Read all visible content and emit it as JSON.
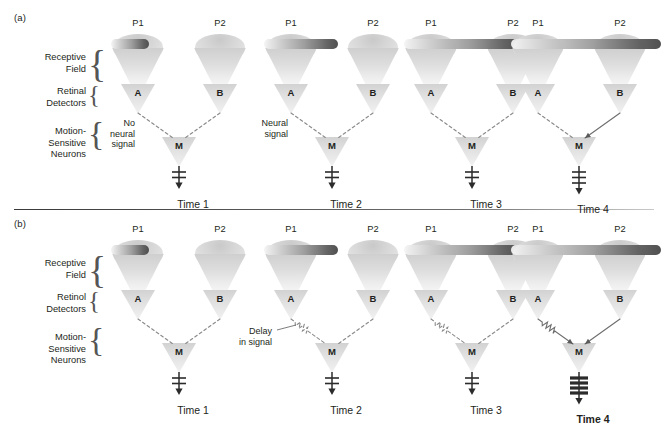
{
  "figure": {
    "panels": [
      {
        "tag": "(a)",
        "row_labels": {
          "receptive_field": "Receptive\nField",
          "detectors": "Retinal\nDetectors",
          "neurons": "Motion-\nSensitive\nNeurons"
        },
        "columns": [
          {
            "time_label": "Time 1",
            "time_bold": false,
            "p1_label": "P1",
            "p2_label": "P2",
            "detector_left": "A",
            "detector_right": "B",
            "neuron": "M",
            "annotation": "No\nneural\nsignal",
            "bar_start": 0,
            "bar_end": 38,
            "left_line": "dashed",
            "right_line": "dashed",
            "left_delay": false,
            "spikes": 2,
            "spike_weight": "thin"
          },
          {
            "time_label": "Time 2",
            "time_bold": false,
            "p1_label": "P1",
            "p2_label": "P2",
            "detector_left": "A",
            "detector_right": "B",
            "neuron": "M",
            "annotation": "Neural\nsignal",
            "bar_start": 0,
            "bar_end": 74,
            "left_line": "dashed",
            "right_line": "dashed",
            "left_delay": false,
            "spikes": 2,
            "spike_weight": "thin"
          },
          {
            "time_label": "Time 3",
            "time_bold": false,
            "p1_label": "P1",
            "p2_label": "P2",
            "detector_left": "A",
            "detector_right": "B",
            "neuron": "M",
            "annotation": "",
            "bar_start": 0,
            "bar_end": 118,
            "left_line": "dashed",
            "right_line": "dashed",
            "left_delay": false,
            "spikes": 2,
            "spike_weight": "thin"
          },
          {
            "time_label": "Time 4",
            "time_bold": false,
            "p1_label": "P1",
            "p2_label": "P2",
            "detector_left": "A",
            "detector_right": "B",
            "neuron": "M",
            "annotation": "",
            "bar_start": 0,
            "bar_end": 150,
            "left_line": "dashed",
            "right_line": "solid",
            "left_delay": false,
            "spikes": 3,
            "spike_weight": "thin"
          }
        ]
      },
      {
        "tag": "(b)",
        "row_labels": {
          "receptive_field": "Receptive\nField",
          "detectors": "Retinol\nDetectors",
          "neurons": "Motion-\nSensitive\nNeurons"
        },
        "columns": [
          {
            "time_label": "Time 1",
            "time_bold": false,
            "p1_label": "P1",
            "p2_label": "P2",
            "detector_left": "A",
            "detector_right": "B",
            "neuron": "M",
            "annotation": "",
            "bar_start": 0,
            "bar_end": 38,
            "left_line": "dashed",
            "right_line": "dashed",
            "left_delay": false,
            "spikes": 2,
            "spike_weight": "thin"
          },
          {
            "time_label": "Time 2",
            "time_bold": false,
            "p1_label": "P1",
            "p2_label": "P2",
            "detector_left": "A",
            "detector_right": "B",
            "neuron": "M",
            "annotation": "Delay\nin signal",
            "bar_start": 0,
            "bar_end": 74,
            "left_line": "dashed",
            "right_line": "dashed",
            "left_delay": true,
            "spikes": 2,
            "spike_weight": "thin"
          },
          {
            "time_label": "Time 3",
            "time_bold": false,
            "p1_label": "P1",
            "p2_label": "P2",
            "detector_left": "A",
            "detector_right": "B",
            "neuron": "M",
            "annotation": "",
            "bar_start": 0,
            "bar_end": 118,
            "left_line": "dashed",
            "right_line": "dashed",
            "left_delay": true,
            "spikes": 2,
            "spike_weight": "thin"
          },
          {
            "time_label": "Time 4",
            "time_bold": true,
            "p1_label": "P1",
            "p2_label": "P2",
            "detector_left": "A",
            "detector_right": "B",
            "neuron": "M",
            "annotation": "",
            "bar_start": 0,
            "bar_end": 150,
            "left_line": "solid",
            "right_line": "solid",
            "left_delay": true,
            "spikes": 4,
            "spike_weight": "thick"
          }
        ]
      }
    ]
  },
  "colors": {
    "ink": "#231f20",
    "bar_dark": "#4a4a4a",
    "bar_light": "#f2f2f2",
    "shape_fill": "#dcdcdc",
    "line": "#777777",
    "divider": "#3a3a3a"
  }
}
